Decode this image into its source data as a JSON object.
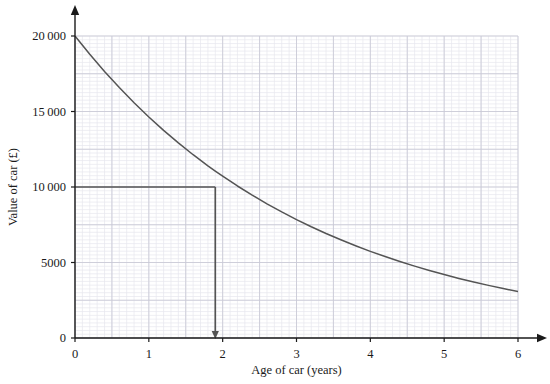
{
  "chart_data": {
    "type": "line",
    "title": "",
    "xlabel": "Age of car (years)",
    "ylabel": "Value of car (£)",
    "xlim": [
      0,
      6
    ],
    "ylim": [
      0,
      20000
    ],
    "grid": true,
    "grid_major_x_step": 1,
    "grid_major_y_step": 2500,
    "grid_minor_per_major_x": 10,
    "grid_minor_per_major_y": 10,
    "legend": null,
    "legend_position": "none",
    "x_tick_labels": [
      "0",
      "1",
      "2",
      "3",
      "4",
      "5",
      "6"
    ],
    "x_tick_values": [
      0,
      1,
      2,
      3,
      4,
      5,
      6
    ],
    "y_tick_labels": [
      "0",
      "5000",
      "10 000",
      "15 000",
      "20 000"
    ],
    "y_tick_values": [
      0,
      5000,
      10000,
      15000,
      20000
    ],
    "series": [
      {
        "name": "Value of car",
        "color": "#545454",
        "x": [
          0,
          0.2,
          0.4,
          0.6,
          0.8,
          1.0,
          1.2,
          1.4,
          1.6,
          1.8,
          1.9,
          2.0,
          2.2,
          2.4,
          2.6,
          2.8,
          3.0,
          3.2,
          3.4,
          3.6,
          3.8,
          4.0,
          4.2,
          4.4,
          4.6,
          4.8,
          5.0,
          5.2,
          5.4,
          5.6,
          5.8,
          6.0
        ],
        "values": [
          20000,
          18790,
          17653,
          16585,
          15581,
          14638,
          13752,
          12920,
          12138,
          11404,
          11055,
          10715,
          10067,
          9458,
          8886,
          8348,
          7843,
          7368,
          6922,
          6503,
          6110,
          5740,
          5393,
          5067,
          4760,
          4472,
          4202,
          3947,
          3708,
          3484,
          3273,
          3075
        ]
      }
    ],
    "annotations": [
      {
        "name": "reading-off-construction-lines",
        "type": "reading-lines",
        "color": "#545454",
        "horizontal_from_x": 0,
        "horizontal_y": 10000,
        "intersection_x": 1.9,
        "intersection_y": 10000,
        "vertical_to_y": 0,
        "arrowhead": "down"
      }
    ]
  },
  "axes": {
    "x_axis_arrow": true,
    "y_axis_arrow": true,
    "axis_color": "#1a1a1a"
  },
  "colors": {
    "curve": "#545454",
    "construction_line": "#545454",
    "grid_major": "#c9c9d6",
    "grid_minor": "#e6e6ee",
    "axis": "#1a1a1a",
    "background": "#ffffff"
  }
}
